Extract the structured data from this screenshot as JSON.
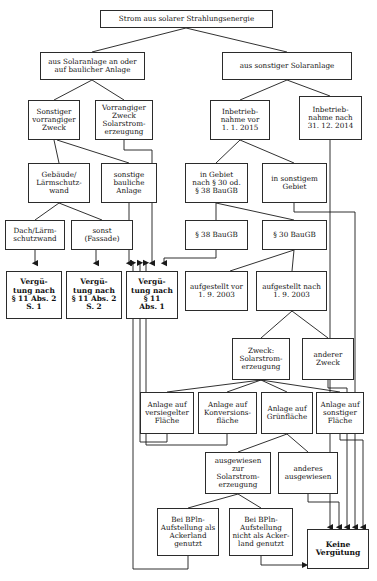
{
  "diagram": {
    "title": "Strom aus solarer Strahlungsenergie",
    "language": "de",
    "nodes": [
      {
        "id": "root",
        "label": "Strom aus solarer Strahlungsenergie",
        "x": 100,
        "y": 10,
        "w": 173,
        "h": 18,
        "size": 7.2,
        "bold": false
      },
      {
        "id": "baulich",
        "label": "aus Solaranlage an oder\nauf baulicher Anlage",
        "x": 40,
        "y": 52,
        "w": 105,
        "h": 28,
        "size": 7.2,
        "bold": false
      },
      {
        "id": "sonstige",
        "label": "aus sonstiger Solaranlage",
        "x": 222,
        "y": 52,
        "w": 130,
        "h": 28,
        "size": 7.2,
        "bold": false
      },
      {
        "id": "sonstzweck",
        "label": "Sonstiger\nvorrangiger\nZweck",
        "x": 28,
        "y": 100,
        "w": 52,
        "h": 40,
        "size": 7.2,
        "bold": false
      },
      {
        "id": "vorrzweck",
        "label": "Vorrangiger\nZweck\nSolarstrom-\nerzeugung",
        "x": 95,
        "y": 100,
        "w": 58,
        "h": 40,
        "size": 7.2,
        "bold": false
      },
      {
        "id": "ibnvor",
        "label": "Inbetrieb-\nnahme vor\n1. 1. 2015",
        "x": 210,
        "y": 100,
        "w": 60,
        "h": 40,
        "size": 7.2,
        "bold": false
      },
      {
        "id": "ibnnach",
        "label": "Inbetrieb-\nnahme nach\n31. 12. 2014",
        "x": 299,
        "y": 96,
        "w": 63,
        "h": 44,
        "size": 7.2,
        "bold": false
      },
      {
        "id": "gebaeude",
        "label": "Gebäude/\nLärmschutz-\nwand",
        "x": 28,
        "y": 163,
        "w": 62,
        "h": 40,
        "size": 7.2,
        "bold": false
      },
      {
        "id": "sonstbau",
        "label": "sonstige\nbauliche\nAnlage",
        "x": 101,
        "y": 163,
        "w": 56,
        "h": 40,
        "size": 7.2,
        "bold": false
      },
      {
        "id": "ingebiet",
        "label": "in Gebiet\nnach § 30 od.\n§ 38  BauGB",
        "x": 185,
        "y": 163,
        "w": 63,
        "h": 40,
        "size": 7.2,
        "bold": false
      },
      {
        "id": "sonstgebiet",
        "label": "in sonstigem\nGebiet",
        "x": 262,
        "y": 163,
        "w": 65,
        "h": 40,
        "size": 7.2,
        "bold": false
      },
      {
        "id": "dachlaerm",
        "label": "Dach/Lärm-\nschutzwand",
        "x": 5,
        "y": 220,
        "w": 60,
        "h": 30,
        "size": 7.2,
        "bold": false
      },
      {
        "id": "fassade",
        "label": "sonst\n(Fassade)",
        "x": 71,
        "y": 220,
        "w": 62,
        "h": 30,
        "size": 7.2,
        "bold": false
      },
      {
        "id": "p38",
        "label": "§ 38 BauGB",
        "x": 185,
        "y": 220,
        "w": 63,
        "h": 30,
        "size": 7.2,
        "bold": false
      },
      {
        "id": "p30",
        "label": "§ 30 BauGB",
        "x": 262,
        "y": 220,
        "w": 65,
        "h": 30,
        "size": 7.2,
        "bold": false
      },
      {
        "id": "verg11a2s1",
        "label": "Vergü-\ntung nach\n§ 11 Abs. 2\nS. 1",
        "x": 6,
        "y": 271,
        "w": 56,
        "h": 48,
        "size": 7.4,
        "bold": true
      },
      {
        "id": "verg11a2s2",
        "label": "Vergü-\ntung nach\n§ 11 Abs. 2\nS. 2",
        "x": 66,
        "y": 271,
        "w": 56,
        "h": 48,
        "size": 7.4,
        "bold": true
      },
      {
        "id": "verg11a1",
        "label": "Vergü-\ntung nach\n§ 11\nAbs. 1",
        "x": 126,
        "y": 271,
        "w": 52,
        "h": 48,
        "size": 7.4,
        "bold": true
      },
      {
        "id": "aufgvor",
        "label": "aufgestellt vor\n1. 9. 2003",
        "x": 185,
        "y": 271,
        "w": 63,
        "h": 40,
        "size": 7.2,
        "bold": false
      },
      {
        "id": "aufgnach",
        "label": "aufgestellt nach\n1. 9. 2003",
        "x": 256,
        "y": 271,
        "w": 71,
        "h": 40,
        "size": 7.2,
        "bold": false
      },
      {
        "id": "zwecksolar",
        "label": "Zweck:\nSolarstrom-\nerzeugung",
        "x": 232,
        "y": 338,
        "w": 58,
        "h": 42,
        "size": 7.2,
        "bold": false
      },
      {
        "id": "andererzw",
        "label": "anderer\nZweck",
        "x": 302,
        "y": 338,
        "w": 52,
        "h": 42,
        "size": 7.2,
        "bold": false
      },
      {
        "id": "anlversieg",
        "label": "Anlage auf\nversiegelter\nFläche",
        "x": 140,
        "y": 392,
        "w": 54,
        "h": 42,
        "size": 7.2,
        "bold": false
      },
      {
        "id": "anlkonv",
        "label": "Anlage auf\nKonversions-\nfläche",
        "x": 198,
        "y": 392,
        "w": 59,
        "h": 42,
        "size": 7.2,
        "bold": false
      },
      {
        "id": "anlgruen",
        "label": "Anlage auf\nGrünfläche",
        "x": 261,
        "y": 392,
        "w": 52,
        "h": 42,
        "size": 7.2,
        "bold": false
      },
      {
        "id": "anlsonst",
        "label": "Anlage auf\nsonstiger\nFläche",
        "x": 316,
        "y": 392,
        "w": 48,
        "h": 42,
        "size": 7.2,
        "bold": false
      },
      {
        "id": "ausgsolar",
        "label": "ausgewiesen zur\nSolarstrom-\nerzeugung",
        "x": 205,
        "y": 452,
        "w": 66,
        "h": 42,
        "size": 7.2,
        "bold": false
      },
      {
        "id": "andausg",
        "label": "anderes\nausgewiesen",
        "x": 278,
        "y": 452,
        "w": 60,
        "h": 42,
        "size": 7.2,
        "bold": false
      },
      {
        "id": "bplnacker",
        "label": "Bei BPln-\nAufstellung als\nAckerland\ngenutzt",
        "x": 157,
        "y": 508,
        "w": 62,
        "h": 48,
        "size": 7.2,
        "bold": false
      },
      {
        "id": "bplnnicht",
        "label": "Bei BPln-\nAufstellung\nnicht als Acker-\nland genutzt",
        "x": 229,
        "y": 508,
        "w": 64,
        "h": 48,
        "size": 7.2,
        "bold": false
      },
      {
        "id": "keineverg",
        "label": "Keine\nVergütung",
        "x": 307,
        "y": 529,
        "w": 62,
        "h": 40,
        "size": 7.6,
        "bold": true
      }
    ],
    "edges": [
      {
        "from": "root",
        "to": "baulich",
        "d": "M186,28 L92,52",
        "arrow": false
      },
      {
        "from": "root",
        "to": "sonstige",
        "d": "M186,28 L287,52",
        "arrow": false
      },
      {
        "from": "baulich",
        "to": "sonstzweck",
        "d": "M92,80 L54,100",
        "arrow": false
      },
      {
        "from": "baulich",
        "to": "vorrzweck",
        "d": "M92,80 L124,100",
        "arrow": false
      },
      {
        "from": "sonstige",
        "to": "ibnvor",
        "d": "M287,80 L240,100",
        "arrow": false
      },
      {
        "from": "sonstige",
        "to": "ibnnach",
        "d": "M287,80 L330,96",
        "arrow": false
      },
      {
        "from": "sonstzweck",
        "to": "gebaeude",
        "d": "M54,140 L59,163",
        "arrow": false
      },
      {
        "from": "sonstzweck",
        "to": "sonstbau",
        "d": "M57,140 L129,163",
        "arrow": false
      },
      {
        "from": "vorrzweck",
        "to": "verg11a1",
        "d": "M124,140 L124,150 L152,150 L152,263",
        "arrow": true
      },
      {
        "from": "ibnvor",
        "to": "ingebiet",
        "d": "M240,140 L216,163",
        "arrow": false
      },
      {
        "from": "ibnvor",
        "to": "sonstgebiet",
        "d": "M240,140 L294,163",
        "arrow": false
      },
      {
        "from": "ibnnach",
        "to": "keineverg",
        "d": "M330,140 L330,527",
        "arrow": true
      },
      {
        "from": "gebaeude",
        "to": "dachlaerm",
        "d": "M59,203 L35,220",
        "arrow": false
      },
      {
        "from": "gebaeude",
        "to": "fassade",
        "d": "M59,203 L102,220",
        "arrow": false
      },
      {
        "from": "sonstbau",
        "to": "verg11a1",
        "d": "M129,203 L129,263",
        "arrow": true
      },
      {
        "from": "ingebiet",
        "to": "p38",
        "d": "M216,203 L216,220",
        "arrow": false
      },
      {
        "from": "ingebiet",
        "to": "p30",
        "d": "M216,203 L294,220",
        "arrow": false
      },
      {
        "from": "sonstgebiet",
        "to": "sonstigrail",
        "d": "M294,203 L294,212 L355,212 L355,527",
        "arrow": true
      },
      {
        "from": "dachlaerm",
        "to": "verg11a2s1",
        "d": "M35,250 L35,263",
        "arrow": true
      },
      {
        "from": "fassade",
        "to": "verg11a2s2",
        "d": "M96,250 L96,263",
        "arrow": true
      },
      {
        "from": "p38",
        "to": "verg11a1",
        "d": "M216,250 L216,258 L164,258 L164,263",
        "arrow": true
      },
      {
        "from": "p30",
        "to": "aufgvor",
        "d": "M294,250 L230,271",
        "arrow": false
      },
      {
        "from": "p30",
        "to": "aufgnach",
        "d": "M294,250 L292,271",
        "arrow": false
      },
      {
        "from": "aufgnach",
        "to": "zwecksolar",
        "d": "M292,311 L261,338",
        "arrow": false
      },
      {
        "from": "aufgnach",
        "to": "andererzw",
        "d": "M292,311 L328,338",
        "arrow": false
      },
      {
        "from": "andererzw",
        "to": "keinerail",
        "d": "M328,380 L328,388 L347,388 L347,527",
        "arrow": true
      },
      {
        "from": "zwecksolar",
        "to": "anlversieg",
        "d": "M261,380 L167,392",
        "arrow": false
      },
      {
        "from": "zwecksolar",
        "to": "anlkonv",
        "d": "M261,380 L227,392",
        "arrow": false
      },
      {
        "from": "zwecksolar",
        "to": "anlgruen",
        "d": "M261,380 L287,392",
        "arrow": false
      },
      {
        "from": "zwecksolar",
        "to": "anlsonst",
        "d": "M261,380 L340,392",
        "arrow": false
      },
      {
        "from": "anlversieg",
        "to": "verg11a1",
        "d": "M167,434 L167,442 L140,442 L140,263",
        "arrow": true
      },
      {
        "from": "anlkonv",
        "to": "verg11a1",
        "d": "M227,434 L227,445 L146,445 L146,263",
        "arrow": true
      },
      {
        "from": "anlgruen",
        "to": "ausgsolar",
        "d": "M287,434 L238,452",
        "arrow": false
      },
      {
        "from": "anlgruen",
        "to": "andausg",
        "d": "M287,434 L308,452",
        "arrow": false
      },
      {
        "from": "anlsonst",
        "to": "keinerail",
        "d": "M340,434 L340,440 L363,440 L363,527",
        "arrow": true
      },
      {
        "from": "andausg",
        "to": "keinerail",
        "d": "M308,494 L308,502 L339,502 L339,527",
        "arrow": true
      },
      {
        "from": "ausgsolar",
        "to": "bplnacker",
        "d": "M238,494 L188,508",
        "arrow": false
      },
      {
        "from": "ausgsolar",
        "to": "bplnnicht",
        "d": "M238,494 L261,508",
        "arrow": false
      },
      {
        "from": "bplnacker",
        "to": "verg11a1",
        "d": "M188,556 L188,569 L133,569 L133,263",
        "arrow": true
      },
      {
        "from": "bplnnicht",
        "to": "keineverg",
        "d": "M261,556 L261,565 L305,565",
        "arrow": true
      }
    ]
  }
}
